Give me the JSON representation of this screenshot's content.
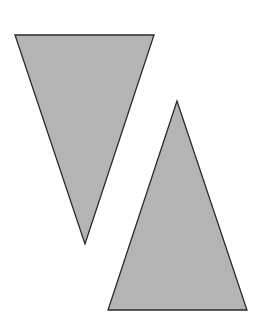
{
  "canvas": {
    "width": 262,
    "height": 332,
    "background": "#ffffff"
  },
  "style": {
    "fill": "#b4b4b4",
    "stroke": "#2a2a2a",
    "stroke_width": 1.3
  },
  "shapes": [
    {
      "name": "inverted-triangle",
      "points": "15,35 154,35 85,244"
    },
    {
      "name": "upright-triangle",
      "points": "177,101 108,310 247,310"
    }
  ]
}
